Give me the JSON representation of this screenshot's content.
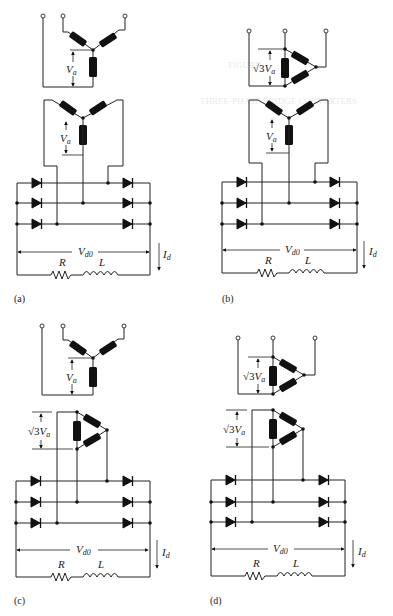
{
  "figure": {
    "panels": [
      {
        "id": "a",
        "caption": "(a)",
        "primary": "wye",
        "secondary": "wye",
        "primary_label": {
          "main": "V",
          "sub": "a"
        },
        "secondary_label": {
          "main": "V",
          "sub": "a"
        }
      },
      {
        "id": "b",
        "caption": "(b)",
        "primary": "delta",
        "secondary": "wye",
        "primary_label": {
          "root": "√3",
          "main": "V",
          "sub": "a"
        },
        "secondary_label": {
          "main": "V",
          "sub": "a"
        }
      },
      {
        "id": "c",
        "caption": "(c)",
        "primary": "wye",
        "secondary": "delta",
        "primary_label": {
          "main": "V",
          "sub": "a"
        },
        "secondary_label": {
          "root": "√3",
          "main": "V",
          "sub": "a"
        }
      },
      {
        "id": "d",
        "caption": "(d)",
        "primary": "delta",
        "secondary": "delta",
        "primary_label": {
          "root": "√3",
          "main": "V",
          "sub": "a"
        },
        "secondary_label": {
          "root": "√3",
          "main": "V",
          "sub": "a"
        }
      }
    ],
    "load": {
      "voltage": {
        "main": "V",
        "sub": "d0"
      },
      "current": {
        "main": "I",
        "sub": "d"
      },
      "resistor": "R",
      "inductor": "L"
    }
  },
  "labels": {
    "cap_a": "(a)",
    "cap_b": "(b)",
    "cap_c": "(c)",
    "cap_d": "(d)",
    "va": "V",
    "va_sub": "a",
    "root3": "√3",
    "vd0": "V",
    "vd0_sub": "d0",
    "id": "I",
    "id_sub": "d",
    "R": "R",
    "L": "L"
  },
  "bleed_through": [
    "THREE-PHASE BRIDGE CONVERTERS",
    "FIGURE"
  ]
}
